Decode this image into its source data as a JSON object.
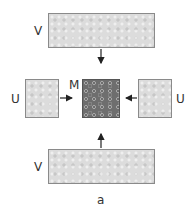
{
  "diagram": {
    "top_box": {
      "label": "V"
    },
    "left_box": {
      "label": "U"
    },
    "center_box": {
      "label": "M"
    },
    "right_box": {
      "label": "U"
    },
    "bottom_box": {
      "label": "V"
    },
    "caption": "a",
    "arrows": [
      {
        "from": "top_box",
        "to": "center_box"
      },
      {
        "from": "left_box",
        "to": "center_box"
      },
      {
        "from": "right_box",
        "to": "center_box"
      },
      {
        "from": "bottom_box",
        "to": "center_box"
      }
    ],
    "colors": {
      "light_fill": "#dcdcdc",
      "dark_fill": "#6e6e6e",
      "border": "#8a8a8a"
    }
  }
}
